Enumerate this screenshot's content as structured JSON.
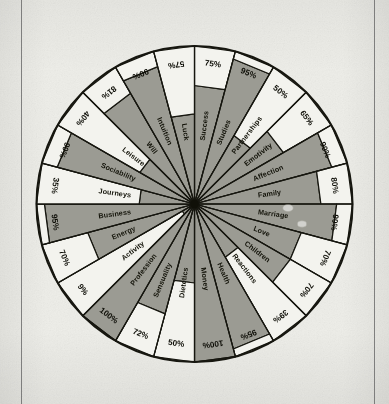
{
  "page": {
    "kind": "printed-diagram-scan",
    "background_color": "#eeeee9",
    "rule_color": "#6d6d6d"
  },
  "chart_data": {
    "type": "pie",
    "subtype": "radial-wheel-percentage",
    "title": "",
    "subtitle": "",
    "xlabel": "",
    "ylabel": "",
    "sector_count": 24,
    "value_unit": "%",
    "value_range": [
      0,
      100
    ],
    "grid": false,
    "legend": "none",
    "start_angle_deg": -90,
    "direction": "clockwise",
    "colors": {
      "filled": "#9b9b93",
      "empty": "#f3f3ee",
      "outline": "#16160f",
      "hub": "#101008"
    },
    "categories": [
      "Success",
      "Studies",
      "Partnerships",
      "Emotivity",
      "Affection",
      "Family",
      "Marriage",
      "Love",
      "Children",
      "Reactions",
      "Health",
      "Money",
      "Dietetics",
      "Sensuality",
      "Profession",
      "Activity",
      "Energy",
      "Business",
      "Journeys",
      "Sociability",
      "Leisure",
      "Will",
      "Intuition",
      "Luck"
    ],
    "values": [
      75,
      95,
      50,
      65,
      90,
      80,
      90,
      70,
      70,
      39,
      95,
      100,
      50,
      72,
      100,
      9,
      70,
      95,
      35,
      90,
      40,
      81,
      90,
      57
    ],
    "labels": [
      "75%",
      "95%",
      "50%",
      "65%",
      "90%",
      "80%",
      "90%",
      "70%",
      "70%",
      "39%",
      "95%",
      "100%",
      "50%",
      "72%",
      "100%",
      "9%",
      "70%",
      "95%",
      "35%",
      "90%",
      "40%",
      "81%",
      "90%",
      "57%"
    ],
    "series": [
      {
        "name": "",
        "values": [
          75,
          95,
          50,
          65,
          90,
          80,
          90,
          70,
          70,
          39,
          95,
          100,
          50,
          72,
          100,
          9,
          70,
          95,
          35,
          90,
          40,
          81,
          90,
          57
        ]
      }
    ],
    "annotations": []
  }
}
